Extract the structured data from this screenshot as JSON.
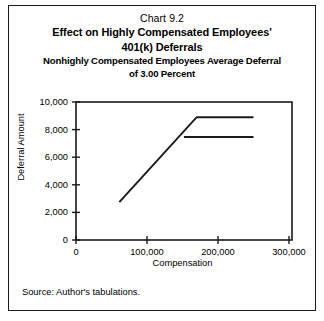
{
  "page": {
    "chart_number": "Chart 9.2",
    "title_line1": "Effect on Highly Compensated Employees'",
    "title_line2": "401(k) Deferrals",
    "subtitle_line1": "Nonhighly Compensated Employees Average Deferral",
    "subtitle_line2": "of 3.00 Percent",
    "source_note": "Source: Author's tabulations."
  },
  "chart_data": {
    "type": "line",
    "title": "Effect on Highly Compensated Employees' 401(k) Deferrals",
    "subtitle": "Nonhighly Compensated Employees Average Deferral of 3.00 Percent",
    "xlabel": "Compensation",
    "ylabel": "Deferral Amount",
    "xlim": [
      0,
      300000
    ],
    "ylim": [
      0,
      10000
    ],
    "xticks": [
      0,
      100000,
      200000,
      300000
    ],
    "xtick_labels": [
      "0",
      "100,000",
      "200,000",
      "300,000"
    ],
    "yticks": [
      0,
      2000,
      4000,
      6000,
      8000,
      10000
    ],
    "ytick_labels": [
      "0",
      "2,000",
      "4,000",
      "6,000",
      "8,000",
      "10,000"
    ],
    "grid": false,
    "legend": "none",
    "series": [
      {
        "name": "Deferral before limit",
        "x": [
          61000,
          170000,
          250000
        ],
        "values": [
          2750,
          8900,
          8900
        ]
      },
      {
        "name": "Deferral after limit",
        "x": [
          152000,
          250000
        ],
        "values": [
          7460,
          7460
        ]
      }
    ]
  }
}
